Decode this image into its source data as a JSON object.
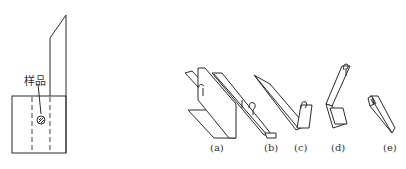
{
  "figure": {
    "left_panel": {
      "sample_label": "样品"
    },
    "right_panel": {
      "sub_labels": [
        "(a)",
        "(b)",
        "(c)",
        "(d)",
        "(e)"
      ]
    }
  },
  "colors": {
    "line": "#2a2a2a",
    "background": "#ffffff",
    "text": "#333333"
  }
}
